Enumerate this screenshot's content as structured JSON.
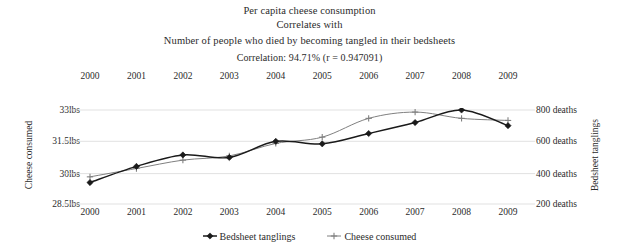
{
  "title": {
    "line1": "Per capita cheese consumption",
    "line2": "Correlates with",
    "line3": "Number of people who died by becoming tangled in their bedsheets",
    "line4": "Correlation: 94.71% (r = 0.947091)"
  },
  "axes": {
    "left_title": "Cheese consumed",
    "right_title": "Bedsheet tanglings",
    "left_ticks": [
      "33lbs",
      "31.5lbs",
      "30lbs",
      "28.5lbs"
    ],
    "right_ticks": [
      "800 deaths",
      "600 deaths",
      "400 deaths",
      "200 deaths"
    ],
    "years": [
      "2000",
      "2001",
      "2002",
      "2003",
      "2004",
      "2005",
      "2006",
      "2007",
      "2008",
      "2009"
    ]
  },
  "legend": [
    {
      "label": "Bedsheet tanglings",
      "marker": "filled-diamond",
      "color": "#1a1a1a"
    },
    {
      "label": "Cheese consumed",
      "marker": "plus-cross",
      "color": "#808080"
    }
  ],
  "chart_data": {
    "type": "line",
    "title": "Per capita cheese consumption Correlates with Number of people who died by becoming tangled in their bedsheets",
    "subtitle": "Correlation: 94.71% (r = 0.947091)",
    "x": [
      2000,
      2001,
      2002,
      2003,
      2004,
      2005,
      2006,
      2007,
      2008,
      2009
    ],
    "xlabel": "",
    "grid": true,
    "legend_position": "bottom",
    "series": [
      {
        "name": "Bedsheet tanglings",
        "axis": "right",
        "ylabel": "Bedsheet tanglings",
        "ylim": [
          200,
          800
        ],
        "unit": "deaths",
        "color": "#1a1a1a",
        "marker": "filled-diamond",
        "values": [
          337,
          440,
          513,
          497,
          600,
          584,
          650,
          720,
          800,
          700
        ]
      },
      {
        "name": "Cheese consumed",
        "axis": "left",
        "ylabel": "Cheese consumed",
        "ylim": [
          28.5,
          33.0
        ],
        "unit": "lbs",
        "color": "#808080",
        "marker": "plus-cross",
        "values": [
          29.8,
          30.2,
          30.6,
          30.8,
          31.4,
          31.7,
          32.6,
          32.9,
          32.6,
          32.5
        ]
      }
    ]
  }
}
